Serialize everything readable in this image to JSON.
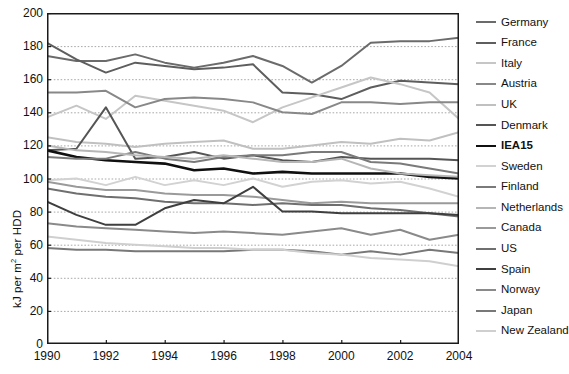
{
  "chart_data": {
    "type": "line",
    "title": "",
    "xlabel": "",
    "ylabel": "kJ per m² per HDD",
    "ylabel_prefix": "kJ per m",
    "ylabel_sup": "2",
    "ylabel_suffix": " per HDD",
    "x": [
      1990,
      1991,
      1992,
      1993,
      1994,
      1995,
      1996,
      1997,
      1998,
      1999,
      2000,
      2001,
      2002,
      2003,
      2004
    ],
    "xlim": [
      1990,
      2004
    ],
    "ylim": [
      0,
      200
    ],
    "yticks": [
      0,
      20,
      40,
      60,
      80,
      100,
      120,
      140,
      160,
      180,
      200
    ],
    "xticks": [
      1990,
      1992,
      1994,
      1996,
      1998,
      2000,
      2002,
      2004
    ],
    "grid": "horizontal-dotted",
    "legend_position": "right",
    "series": [
      {
        "name": "Germany",
        "color": "#6b6b6b",
        "width": 2.0,
        "values": [
          174,
          171,
          171,
          175,
          170,
          167,
          170,
          174,
          168,
          158,
          168,
          182,
          183,
          183,
          185
        ]
      },
      {
        "name": "France",
        "color": "#5e5e5e",
        "width": 2.0,
        "values": [
          182,
          172,
          164,
          170,
          168,
          166,
          167,
          169,
          152,
          151,
          148,
          155,
          159,
          158,
          157
        ]
      },
      {
        "name": "Italy",
        "color": "#c6c6c6",
        "width": 2.0,
        "values": [
          137,
          144,
          136,
          150,
          147,
          144,
          141,
          134,
          143,
          149,
          155,
          161,
          157,
          152,
          136
        ]
      },
      {
        "name": "Austria",
        "color": "#888888",
        "width": 2.0,
        "values": [
          152,
          152,
          153,
          143,
          148,
          149,
          148,
          146,
          140,
          139,
          146,
          146,
          145,
          146,
          146
        ]
      },
      {
        "name": "UK",
        "color": "#c0c0c0",
        "width": 2.0,
        "values": [
          125,
          122,
          121,
          119,
          121,
          122,
          123,
          118,
          118,
          120,
          122,
          121,
          124,
          123,
          128
        ]
      },
      {
        "name": "Denmark",
        "color": "#555555",
        "width": 2.0,
        "values": [
          117,
          118,
          143,
          112,
          113,
          116,
          112,
          114,
          111,
          110,
          113,
          112,
          112,
          112,
          111
        ]
      },
      {
        "name": "IEA15",
        "color": "#101010",
        "width": 2.6,
        "values": [
          117,
          113,
          111,
          110,
          109,
          105,
          106,
          103,
          104,
          103,
          103,
          103,
          103,
          101,
          100
        ]
      },
      {
        "name": "Sweden",
        "color": "#d2d2d2",
        "width": 2.0,
        "values": [
          99,
          100,
          96,
          101,
          96,
          99,
          96,
          100,
          95,
          98,
          99,
          97,
          98,
          94,
          89
        ]
      },
      {
        "name": "Finland",
        "color": "#7a7a7a",
        "width": 2.0,
        "values": [
          113,
          112,
          112,
          116,
          112,
          110,
          113,
          114,
          114,
          116,
          116,
          110,
          109,
          106,
          103
        ]
      },
      {
        "name": "Netherlands",
        "color": "#b6b6b6",
        "width": 2.0,
        "values": [
          120,
          117,
          116,
          114,
          113,
          112,
          114,
          112,
          110,
          110,
          112,
          106,
          103,
          102,
          101
        ]
      },
      {
        "name": "Canada",
        "color": "#9a9a9a",
        "width": 2.0,
        "values": [
          98,
          95,
          93,
          93,
          91,
          90,
          90,
          89,
          87,
          85,
          86,
          85,
          85,
          85,
          85
        ]
      },
      {
        "name": "US",
        "color": "#6f6f6f",
        "width": 2.0,
        "values": [
          94,
          91,
          89,
          88,
          86,
          85,
          85,
          84,
          85,
          84,
          84,
          82,
          81,
          79,
          77
        ]
      },
      {
        "name": "Spain",
        "color": "#3f3f3f",
        "width": 2.0,
        "values": [
          86,
          78,
          72,
          72,
          82,
          87,
          85,
          95,
          80,
          80,
          79,
          79,
          79,
          79,
          78
        ]
      },
      {
        "name": "Norway",
        "color": "#8a8a8a",
        "width": 2.0,
        "values": [
          73,
          71,
          70,
          69,
          68,
          67,
          68,
          67,
          66,
          68,
          70,
          66,
          69,
          63,
          66
        ]
      },
      {
        "name": "Japan",
        "color": "#787878",
        "width": 2.0,
        "values": [
          58,
          57,
          57,
          56,
          56,
          56,
          56,
          57,
          57,
          56,
          54,
          56,
          54,
          57,
          55
        ]
      },
      {
        "name": "New Zealand",
        "color": "#cfcfcf",
        "width": 2.0,
        "values": [
          65,
          63,
          61,
          60,
          59,
          58,
          58,
          57,
          57,
          55,
          54,
          52,
          51,
          50,
          47
        ]
      }
    ]
  },
  "legend": {
    "items": [
      {
        "label": "Germany"
      },
      {
        "label": "France"
      },
      {
        "label": "Italy"
      },
      {
        "label": "Austria"
      },
      {
        "label": "UK"
      },
      {
        "label": "Denmark"
      },
      {
        "label": "IEA15"
      },
      {
        "label": "Sweden"
      },
      {
        "label": "Finland"
      },
      {
        "label": "Netherlands"
      },
      {
        "label": "Canada"
      },
      {
        "label": "US"
      },
      {
        "label": "Spain"
      },
      {
        "label": "Norway"
      },
      {
        "label": "Japan"
      },
      {
        "label": "New Zealand"
      }
    ]
  },
  "colors": {
    "axis": "#1a1a1a",
    "grid": "#a9a9a9",
    "background": "#ffffff",
    "text": "#111111"
  }
}
